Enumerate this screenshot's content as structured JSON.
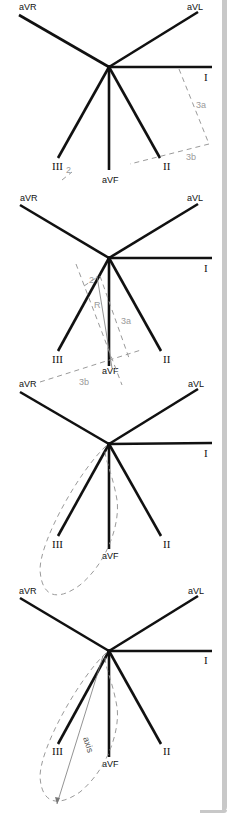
{
  "figure": {
    "lead_labels": {
      "aVR": "aVR",
      "aVL": "aVL",
      "I": "I",
      "II": "II",
      "III": "III",
      "aVF": "aVF"
    },
    "panels": [
      {
        "id": 1,
        "construction_labels": [
          "3a",
          "3b",
          "2"
        ]
      },
      {
        "id": 2,
        "construction_labels": [
          "2",
          "R",
          "3a",
          "3b"
        ]
      },
      {
        "id": 3,
        "construction_labels": []
      },
      {
        "id": 4,
        "construction_labels": [
          "axis"
        ]
      }
    ],
    "colors": {
      "lead_line": "#111111",
      "construction_line": "#9a9a9a",
      "border": "#c8c8c8"
    }
  }
}
